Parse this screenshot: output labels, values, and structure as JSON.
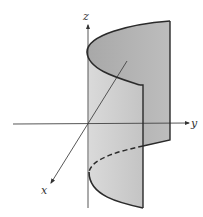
{
  "figure": {
    "axes": {
      "x_label": "x",
      "y_label": "y",
      "z_label": "z"
    },
    "colors": {
      "background": "#ffffff",
      "surface_back": "#b4b4b4",
      "surface_front": "#d2d2d2",
      "edge": "#2a2a2a",
      "axis": "#444444"
    }
  }
}
